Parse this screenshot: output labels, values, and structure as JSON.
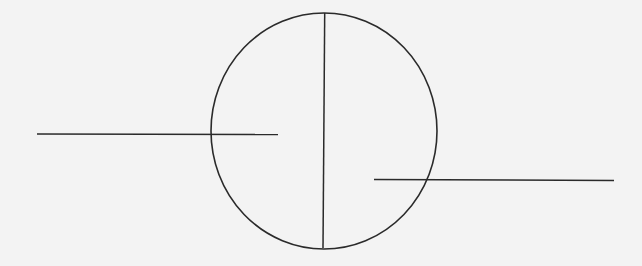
{
  "diagram": {
    "background": "#f3f3f3",
    "stroke": "#2a2a2a",
    "circle": {
      "cx": 324,
      "cy": 131,
      "rx": 113,
      "ry": 118
    },
    "vertical_line": {
      "x1": 324.7,
      "y1": 13,
      "x2": 323,
      "y2": 248
    },
    "left_line": {
      "x1": 37,
      "y1": 134,
      "x2": 278,
      "y2": 134.5
    },
    "right_line": {
      "x1": 374,
      "y1": 179.5,
      "x2": 614,
      "y2": 180.5
    }
  }
}
